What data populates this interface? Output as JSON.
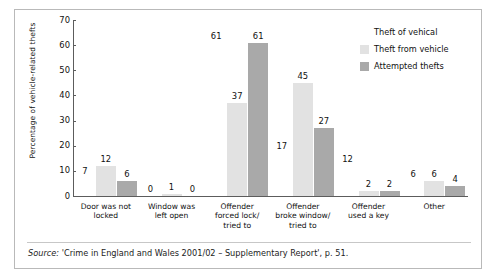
{
  "chart_data": {
    "type": "bar",
    "title": "",
    "xlabel": "",
    "ylabel": "Percentage of vehicle-related thefts",
    "ylim": [
      0,
      70
    ],
    "yticks": [
      0,
      10,
      20,
      30,
      40,
      50,
      60,
      70
    ],
    "grid": false,
    "legend_position": "top-right",
    "legend_title": "Theft of vehical",
    "categories": [
      "Door was not locked",
      "Window was left open",
      "Offender forced lock/ tried to",
      "Offender broke window/ tried to",
      "Offender used a key",
      "Other"
    ],
    "series": [
      {
        "name": "Theft of vehical",
        "color": "#ffffff",
        "values": [
          7,
          0,
          61,
          17,
          12,
          6
        ]
      },
      {
        "name": "Theft from vehicle",
        "color": "#e2e2e2",
        "values": [
          12,
          1,
          37,
          45,
          2,
          6
        ]
      },
      {
        "name": "Attempted thefts",
        "color": "#a9a9a9",
        "values": [
          6,
          0,
          61,
          27,
          2,
          4
        ]
      }
    ]
  },
  "category_lines": [
    [
      "Door was not",
      "locked"
    ],
    [
      "Window was",
      "left open"
    ],
    [
      "Offender",
      "forced lock/",
      "tried to"
    ],
    [
      "Offender",
      "broke window/",
      "tried to"
    ],
    [
      "Offender",
      "used a key"
    ],
    [
      "Other"
    ]
  ],
  "source": {
    "prefix": "Source:",
    "text": " 'Crime in England and Wales 2001/02 – Supplementary Report', p. 51."
  }
}
